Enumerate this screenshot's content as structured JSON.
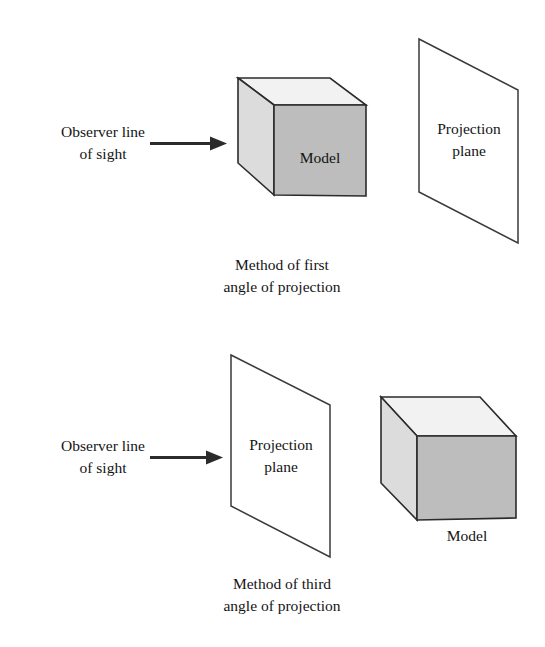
{
  "figure": {
    "background_color": "#ffffff",
    "line_color": "#2b2b2b"
  },
  "colors": {
    "cube_top_face": "#f1f1f1",
    "cube_left_face": "#d9d9d9",
    "cube_front_face": "#bcbcbc",
    "plane_face": "#ffffff",
    "outline": "#2b2b2b",
    "text": "#141414"
  },
  "panels": [
    {
      "id": "first-angle",
      "caption_line1": "Method of first",
      "caption_line2": "angle of projection",
      "observer_label_line1": "Observer line",
      "observer_label_line2": "of sight",
      "arrow_direction": "right",
      "model_label": "Model",
      "plane_label_line1": "Projection",
      "plane_label_line2": "plane",
      "order": "model then plane"
    },
    {
      "id": "third-angle",
      "caption_line1": "Method of third",
      "caption_line2": "angle of projection",
      "observer_label_line1": "Observer line",
      "observer_label_line2": "of sight",
      "arrow_direction": "right",
      "model_label": "Model",
      "plane_label_line1": "Projection",
      "plane_label_line2": "plane",
      "order": "plane then model"
    }
  ]
}
